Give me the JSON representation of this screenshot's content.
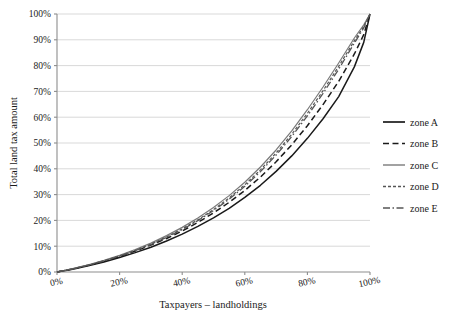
{
  "chart_data": {
    "type": "line",
    "title": "",
    "xlabel": "Taxpayers – landholdings",
    "ylabel": "Total land tax amount",
    "xlim": [
      0,
      100
    ],
    "ylim": [
      0,
      100
    ],
    "xticks": [
      "0%",
      "20%",
      "40%",
      "60%",
      "80%",
      "100%"
    ],
    "xtick_values": [
      0,
      20,
      40,
      60,
      80,
      100
    ],
    "yticks": [
      "0%",
      "10%",
      "20%",
      "30%",
      "40%",
      "50%",
      "60%",
      "70%",
      "80%",
      "90%",
      "100%"
    ],
    "ytick_values": [
      0,
      10,
      20,
      30,
      40,
      50,
      60,
      70,
      80,
      90,
      100
    ],
    "grid": "horizontal",
    "legend_position": "right",
    "x": [
      0,
      5,
      10,
      15,
      20,
      25,
      30,
      35,
      40,
      45,
      50,
      55,
      60,
      65,
      70,
      75,
      80,
      85,
      90,
      95,
      98,
      100
    ],
    "series": [
      {
        "name": "zone A",
        "style": "solid",
        "color": "#1a1a1a",
        "width": 1.5,
        "values": [
          0,
          1.1,
          2.4,
          3.9,
          5.6,
          7.5,
          9.6,
          12.0,
          14.7,
          17.7,
          21.0,
          24.7,
          28.9,
          33.6,
          39.0,
          45.0,
          51.8,
          59.4,
          68.0,
          79.5,
          89.0,
          100
        ]
      },
      {
        "name": "zone B",
        "style": "dashed",
        "color": "#1a1a1a",
        "width": 1.5,
        "values": [
          0,
          1.2,
          2.6,
          4.2,
          6.0,
          8.1,
          10.4,
          13.0,
          15.9,
          19.2,
          22.9,
          27.0,
          31.6,
          36.8,
          42.7,
          49.3,
          56.7,
          64.9,
          73.9,
          84.5,
          92.0,
          100
        ]
      },
      {
        "name": "zone C",
        "style": "solid",
        "color": "#7a7a7a",
        "width": 1.2,
        "values": [
          0,
          1.3,
          2.8,
          4.5,
          6.5,
          8.7,
          11.2,
          14.1,
          17.3,
          20.9,
          25.0,
          29.6,
          34.8,
          40.7,
          47.3,
          54.7,
          62.9,
          71.7,
          81.0,
          90.7,
          95.8,
          100
        ]
      },
      {
        "name": "zone D",
        "style": "fine-dashed",
        "color": "#555555",
        "width": 1.2,
        "values": [
          0,
          1.25,
          2.7,
          4.35,
          6.25,
          8.4,
          10.8,
          13.6,
          16.7,
          20.2,
          24.2,
          28.7,
          33.8,
          39.6,
          46.1,
          53.4,
          61.5,
          70.3,
          79.7,
          89.6,
          95.2,
          100
        ]
      },
      {
        "name": "zone E",
        "style": "dash-dot",
        "color": "#555555",
        "width": 1.3,
        "values": [
          0,
          1.22,
          2.65,
          4.28,
          6.15,
          8.28,
          10.65,
          13.4,
          16.45,
          19.9,
          23.8,
          28.2,
          33.2,
          38.9,
          45.3,
          52.5,
          60.5,
          69.2,
          78.6,
          88.7,
          94.6,
          100
        ]
      }
    ]
  },
  "legend": {
    "items": [
      {
        "label": "zone A"
      },
      {
        "label": "zone B"
      },
      {
        "label": "zone C"
      },
      {
        "label": "zone D"
      },
      {
        "label": "zone E"
      }
    ]
  }
}
